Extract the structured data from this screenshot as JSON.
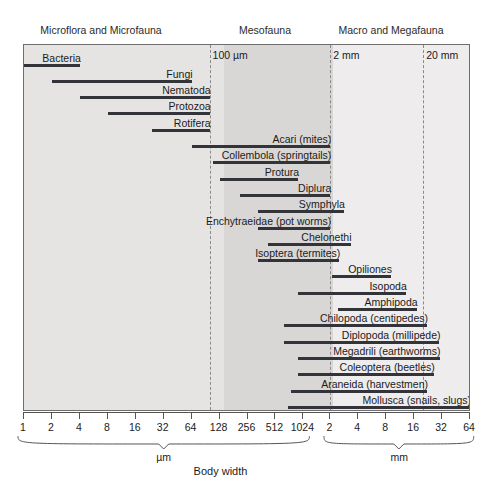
{
  "chart_data": {
    "type": "bar",
    "title": "",
    "xlabel": "Body width",
    "ylabel": "",
    "orientation": "horizontal",
    "scale": "log2",
    "grid": false,
    "legend": null,
    "note": "Horizontal range bars showing body-width span of soil organism groups on a log2 body-width axis spanning 1 um to 64 mm.",
    "zones": [
      {
        "label": "Microflora and Microfauna",
        "x_center_px": 101,
        "range": "1 um - 100 um"
      },
      {
        "label": "Mesofauna",
        "x_center_px": 265,
        "range": "100 um - 2 mm"
      },
      {
        "label": "Macro and Megafauna",
        "x_center_px": 391,
        "range": "2 mm - 64 mm"
      }
    ],
    "boundaries": [
      {
        "label": "100 µm",
        "value_um": 100
      },
      {
        "label": "2 mm",
        "value_um": 2000
      },
      {
        "label": "20 mm",
        "value_um": 20000
      }
    ],
    "x_axis": {
      "um_ticks": [
        "1",
        "2",
        "4",
        "8",
        "16",
        "32",
        "64",
        "128",
        "256",
        "512",
        "1024"
      ],
      "mm_ticks": [
        "2",
        "4",
        "8",
        "16",
        "32",
        "64"
      ],
      "um_unit": "µm",
      "mm_unit": "mm",
      "xlim_um": [
        1,
        64000
      ]
    },
    "categories": [
      "Bacteria",
      "Fungi",
      "Nematoda",
      "Protozoa",
      "Rotifera",
      "Acari (mites)",
      "Collembola (springtails)",
      "Protura",
      "Diplura",
      "Symphyla",
      "Enchytraeidae (pot worms)",
      "Chelonethi",
      "Isoptera (termites)",
      "Opiliones",
      "Isopoda",
      "Amphipoda",
      "Chilopoda (centipedes)",
      "Diplopoda (millipede)",
      "Megadrili (earthworms)",
      "Coleoptera (beetles)",
      "Araneida (harvestmen)",
      "Mollusca (snails, slugs)"
    ],
    "bars": [
      {
        "label": "Bacteria",
        "start_um": 1,
        "end_um": 4
      },
      {
        "label": "Fungi",
        "start_um": 2,
        "end_um": 64
      },
      {
        "label": "Nematoda",
        "start_um": 4,
        "end_um": 100
      },
      {
        "label": "Protozoa",
        "start_um": 8,
        "end_um": 100
      },
      {
        "label": "Rotifera",
        "start_um": 24,
        "end_um": 100
      },
      {
        "label": "Acari (mites)",
        "start_um": 64,
        "end_um": 2000
      },
      {
        "label": "Collembola (springtails)",
        "start_um": 110,
        "end_um": 2000
      },
      {
        "label": "Protura",
        "start_um": 128,
        "end_um": 900
      },
      {
        "label": "Diplura",
        "start_um": 210,
        "end_um": 2000
      },
      {
        "label": "Symphyla",
        "start_um": 330,
        "end_um": 2800
      },
      {
        "label": "Enchytraeidae (pot worms)",
        "start_um": 330,
        "end_um": 2000
      },
      {
        "label": "Chelonethi",
        "start_um": 430,
        "end_um": 3300
      },
      {
        "label": "Isoptera (termites)",
        "start_um": 330,
        "end_um": 2500
      },
      {
        "label": "Opiliones",
        "start_um": 2100,
        "end_um": 9000
      },
      {
        "label": "Isopoda",
        "start_um": 900,
        "end_um": 13000
      },
      {
        "label": "Amphipoda",
        "start_um": 2400,
        "end_um": 17000
      },
      {
        "label": "Chilopoda (centipedes)",
        "start_um": 640,
        "end_um": 22000
      },
      {
        "label": "Diplopoda (millipede)",
        "start_um": 640,
        "end_um": 30000
      },
      {
        "label": "Megadrili (earthworms)",
        "start_um": 900,
        "end_um": 30000
      },
      {
        "label": "Coleoptera (beetles)",
        "start_um": 900,
        "end_um": 26000
      },
      {
        "label": "Araneida (harvestmen)",
        "start_um": 760,
        "end_um": 22000
      },
      {
        "label": "Mollusca (snails, slugs)",
        "start_um": 700,
        "end_um": 64000
      }
    ]
  }
}
